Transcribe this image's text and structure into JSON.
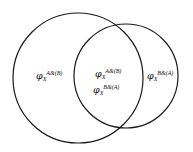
{
  "figure": {
    "type": "venn-diagram",
    "width": 193,
    "height": 152,
    "background_color": "#ffffff",
    "stroke_color": "#1a1a1a",
    "stroke_width": 1.2,
    "fill": "none"
  },
  "circles": [
    {
      "id": "set-a",
      "name": "left-circle",
      "cx": 78,
      "cy": 78,
      "r": 65
    },
    {
      "id": "set-b",
      "name": "right-circle",
      "cx": 126,
      "cy": 76,
      "r": 52
    }
  ],
  "labels": {
    "a_only": {
      "symbol": "φ",
      "subscript": "X",
      "superscript": "A&(B)",
      "region": "left-circle-only"
    },
    "intersection_ab": {
      "symbol": "φ",
      "subscript": "X",
      "superscript": "A&(B)",
      "region": "intersection"
    },
    "intersection_ba": {
      "symbol": "φ",
      "subscript": "X",
      "superscript": "B&(A)",
      "region": "intersection"
    },
    "b_only": {
      "symbol": "φ",
      "subscript": "X",
      "superscript": "B&(A)",
      "region": "right-circle-only"
    }
  }
}
